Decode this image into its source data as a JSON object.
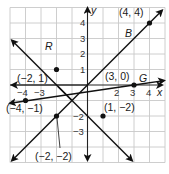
{
  "graph": {
    "origin_px": [
      87.5,
      85
    ],
    "unit_px": 15.5,
    "x_range": [
      -5,
      5
    ],
    "y_range": [
      -5,
      5
    ],
    "axis_labels": {
      "x": "x",
      "y": "y"
    },
    "x_ticks": [
      {
        "value": -4,
        "label": "−4"
      },
      {
        "value": -3,
        "label": "−3"
      },
      {
        "value": 2,
        "label": "2"
      },
      {
        "value": 3,
        "label": "3"
      },
      {
        "value": 4,
        "label": "4"
      }
    ],
    "y_ticks": [
      {
        "value": 4,
        "label": "4"
      },
      {
        "value": 3,
        "label": "3"
      },
      {
        "value": 2,
        "label": "2"
      },
      {
        "value": 1,
        "label": "1"
      },
      {
        "value": -2,
        "label": "−2"
      },
      {
        "value": -3,
        "label": "−3"
      }
    ],
    "lines": [
      {
        "name": "B",
        "label": "B",
        "points": [
          [
            -2,
            -2
          ],
          [
            4,
            4
          ]
        ]
      },
      {
        "name": "R",
        "label": "R",
        "points": [
          [
            -2,
            1
          ],
          [
            1,
            -2
          ]
        ]
      },
      {
        "name": "G",
        "label": "G",
        "points": [
          [
            -4,
            -1
          ],
          [
            3,
            0
          ]
        ]
      }
    ],
    "points": [
      {
        "coords": [
          4,
          4
        ],
        "label": "(4, 4)"
      },
      {
        "coords": [
          -2,
          1
        ],
        "label": "(−2, 1)"
      },
      {
        "coords": [
          3,
          0
        ],
        "label": "(3, 0)"
      },
      {
        "coords": [
          -4,
          -1
        ],
        "label": "(−4, −1)"
      },
      {
        "coords": [
          1,
          -2
        ],
        "label": "(1, −2)"
      },
      {
        "coords": [
          -2,
          -2
        ],
        "label": "(−2, −2)"
      }
    ],
    "colors": {
      "grid": "#c8c8c8",
      "axis": "#222222",
      "line": "#111111"
    }
  }
}
